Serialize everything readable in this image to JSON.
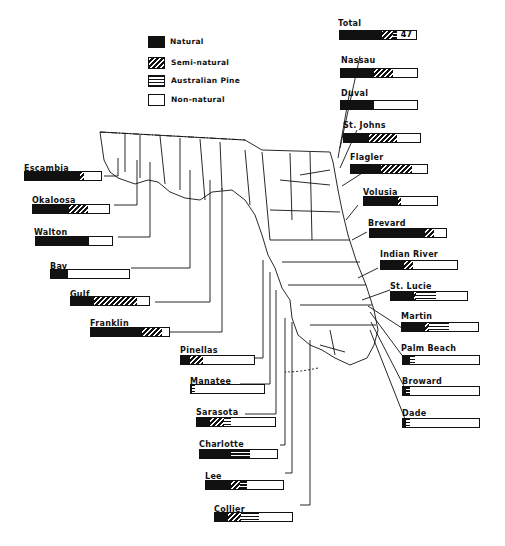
{
  "chart_data": {
    "type": "bar",
    "subtype": "stacked-horizontal-100pct-map-callouts",
    "title": "",
    "legend": [
      {
        "key": "natural",
        "label": "Natural"
      },
      {
        "key": "semi",
        "label": "Semi-natural"
      },
      {
        "key": "pine",
        "label": "Australian Pine"
      },
      {
        "key": "non",
        "label": "Non-natural"
      }
    ],
    "total": {
      "label": "Total",
      "value": "47",
      "natural": 55,
      "semi": 15,
      "pine": 5,
      "non": 25
    },
    "counties": [
      {
        "name": "Nassau",
        "natural": 44,
        "semi": 24,
        "pine": 0,
        "non": 32
      },
      {
        "name": "Duval",
        "natural": 44,
        "semi": 0,
        "pine": 0,
        "non": 56
      },
      {
        "name": "St. Johns",
        "natural": 33,
        "semi": 37,
        "pine": 0,
        "non": 30
      },
      {
        "name": "Flagler",
        "natural": 40,
        "semi": 40,
        "pine": 0,
        "non": 20
      },
      {
        "name": "Volusia",
        "natural": 46,
        "semi": 5,
        "pine": 0,
        "non": 49
      },
      {
        "name": "Brevard",
        "natural": 73,
        "semi": 11,
        "pine": 0,
        "non": 16
      },
      {
        "name": "Indian River",
        "natural": 30,
        "semi": 12,
        "pine": 0,
        "non": 58
      },
      {
        "name": "St. Lucie",
        "natural": 30,
        "semi": 3,
        "pine": 26,
        "non": 41
      },
      {
        "name": "Martin",
        "natural": 30,
        "semi": 5,
        "pine": 27,
        "non": 38
      },
      {
        "name": "Palm Beach",
        "natural": 9,
        "semi": 0,
        "pine": 7,
        "non": 84
      },
      {
        "name": "Broward",
        "natural": 4,
        "semi": 0,
        "pine": 5,
        "non": 91
      },
      {
        "name": "Dade",
        "natural": 4,
        "semi": 0,
        "pine": 5,
        "non": 91
      },
      {
        "name": "Escambia",
        "natural": 73,
        "semi": 5,
        "pine": 0,
        "non": 22
      },
      {
        "name": "Okaloosa",
        "natural": 47,
        "semi": 26,
        "pine": 0,
        "non": 27
      },
      {
        "name": "Walton",
        "natural": 70,
        "semi": 0,
        "pine": 0,
        "non": 30
      },
      {
        "name": "Bay",
        "natural": 22,
        "semi": 0,
        "pine": 0,
        "non": 78
      },
      {
        "name": "Gulf",
        "natural": 29,
        "semi": 55,
        "pine": 0,
        "non": 16
      },
      {
        "name": "Franklin",
        "natural": 65,
        "semi": 26,
        "pine": 0,
        "non": 9
      },
      {
        "name": "Pinellas",
        "natural": 12,
        "semi": 18,
        "pine": 0,
        "non": 70
      },
      {
        "name": "Manatee",
        "natural": 2,
        "semi": 0,
        "pine": 4,
        "non": 94
      },
      {
        "name": "Sarasota",
        "natural": 17,
        "semi": 17,
        "pine": 10,
        "non": 56
      },
      {
        "name": "Charlotte",
        "natural": 40,
        "semi": 0,
        "pine": 25,
        "non": 35
      },
      {
        "name": "Lee",
        "natural": 32,
        "semi": 12,
        "pine": 9,
        "non": 47
      },
      {
        "name": "Collier",
        "natural": 17,
        "semi": 17,
        "pine": 23,
        "non": 43
      }
    ]
  },
  "legend": {
    "natural": "Natural",
    "semi": "Semi-natural",
    "pine": "Australian Pine",
    "non": "Non-natural"
  },
  "total": {
    "label": "Total",
    "value": "47"
  },
  "labels": {
    "nassau": "Nassau",
    "duval": "Duval",
    "stjohns": "St. Johns",
    "flagler": "Flagler",
    "volusia": "Volusia",
    "brevard": "Brevard",
    "indianriver": "Indian River",
    "stlucie": "St. Lucie",
    "martin": "Martin",
    "palmbeach": "Palm Beach",
    "broward": "Broward",
    "dade": "Dade",
    "escambia": "Escambia",
    "okaloosa": "Okaloosa",
    "walton": "Walton",
    "bay": "Bay",
    "gulf": "Gulf",
    "franklin": "Franklin",
    "pinellas": "Pinellas",
    "manatee": "Manatee",
    "sarasota": "Sarasota",
    "charlotte": "Charlotte",
    "lee": "Lee",
    "collier": "Collier"
  }
}
